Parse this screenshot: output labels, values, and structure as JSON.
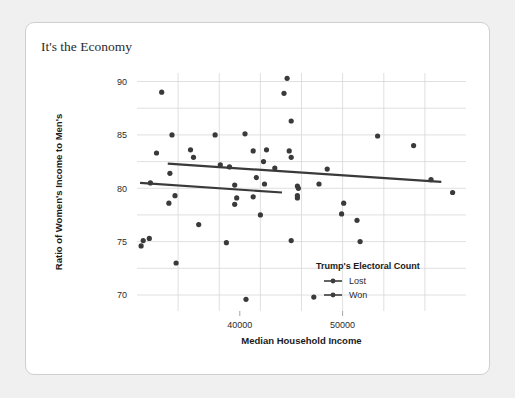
{
  "card": {
    "title": "It's the Economy"
  },
  "chart_data": {
    "type": "scatter",
    "title": "It's the Economy",
    "xlabel": "Median Household Income",
    "ylabel": "Ratio of Women's Income to Men's",
    "xlim": [
      30000,
      62000
    ],
    "ylim": [
      68.5,
      90.8
    ],
    "grid": true,
    "x_ticks": [
      40000,
      50000
    ],
    "x_tick_labels": [
      "40000",
      "50000"
    ],
    "x_gridlines": [
      34000,
      38000,
      42000,
      46000,
      50000,
      54000,
      58000
    ],
    "y_ticks": [
      70,
      75,
      80,
      85,
      90
    ],
    "y_tick_labels": [
      "70",
      "75",
      "80",
      "85",
      "90"
    ],
    "y_gridlines": [
      70,
      72.5,
      75,
      77.5,
      80,
      82.5,
      85,
      87.5,
      90
    ],
    "legend": {
      "title": "Trump's Electoral Count",
      "position": "inside-bottom-right",
      "entries": [
        {
          "name": "Lost",
          "color": "#3d3d3d",
          "marker": "circle-with-line"
        },
        {
          "name": "Won",
          "color": "#3d3d3d",
          "marker": "circle-with-line"
        }
      ]
    },
    "point_color": "#3a3a3a",
    "line_color": "#3a3a3a",
    "series": [
      {
        "name": "Lost",
        "points": [
          [
            32400,
            89.0
          ],
          [
            44600,
            90.3
          ],
          [
            44300,
            88.9
          ],
          [
            45000,
            86.3
          ],
          [
            33400,
            85.0
          ],
          [
            37600,
            85.0
          ],
          [
            40500,
            85.1
          ],
          [
            53400,
            84.9
          ],
          [
            56900,
            84.0
          ],
          [
            44800,
            83.5
          ],
          [
            35200,
            83.6
          ],
          [
            35500,
            82.9
          ],
          [
            41300,
            83.5
          ],
          [
            42600,
            83.6
          ],
          [
            45000,
            82.9
          ],
          [
            31900,
            83.3
          ],
          [
            39000,
            82.0
          ],
          [
            33200,
            81.4
          ],
          [
            38100,
            82.2
          ],
          [
            42300,
            82.5
          ],
          [
            43400,
            81.9
          ],
          [
            48500,
            81.8
          ],
          [
            58600,
            80.8
          ],
          [
            60700,
            79.6
          ],
          [
            41600,
            81.0
          ],
          [
            47700,
            80.4
          ]
        ],
        "trend_line": {
          "x0": 33000,
          "y0": 82.3,
          "x1": 59600,
          "y1": 80.6
        }
      },
      {
        "name": "Won",
        "points": [
          [
            31300,
            80.5
          ],
          [
            39500,
            80.3
          ],
          [
            42400,
            80.4
          ],
          [
            45600,
            80.2
          ],
          [
            45700,
            80.0
          ],
          [
            33700,
            79.3
          ],
          [
            33100,
            78.6
          ],
          [
            39700,
            79.1
          ],
          [
            39500,
            78.5
          ],
          [
            41300,
            79.2
          ],
          [
            45600,
            79.1
          ],
          [
            45600,
            79.3
          ],
          [
            50100,
            78.6
          ],
          [
            31200,
            75.3
          ],
          [
            36000,
            76.6
          ],
          [
            49900,
            77.6
          ],
          [
            51400,
            77.0
          ],
          [
            30600,
            75.1
          ],
          [
            45000,
            75.1
          ],
          [
            51700,
            75.0
          ],
          [
            30400,
            74.6
          ],
          [
            33800,
            73.0
          ],
          [
            38700,
            74.9
          ],
          [
            42000,
            77.5
          ],
          [
            40600,
            69.6
          ],
          [
            47200,
            69.8
          ]
        ],
        "trend_line": {
          "x0": 30300,
          "y0": 80.5,
          "x1": 44100,
          "y1": 79.6
        }
      }
    ]
  }
}
